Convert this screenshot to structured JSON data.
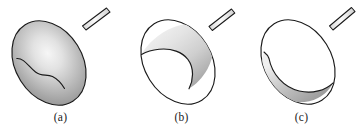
{
  "figure": {
    "background_color": "#ffffff",
    "stroke_color": "#1a1a1a",
    "panels": [
      {
        "id": "a",
        "label": "(a)",
        "caption_text": "(a)",
        "description": "shaded closed ellipsoid balloon with S-curve seam and tube stem",
        "shading": "radial-gradient",
        "highlight_color": "#f4f4f4",
        "mid_color": "#b4b4b4",
        "edge_color": "#8a8a8a",
        "interior_fill": "shaded",
        "has_stem": true
      },
      {
        "id": "b",
        "label": "(b)",
        "caption_text": "(b)",
        "description": "partially open ellipsoid, white circular mouth lower-left, shaded concave interior upper-right",
        "shading": "linear-gradient",
        "highlight_color": "#ededed",
        "mid_color": "#c9c9c9",
        "edge_color": "#9a9a9a",
        "interior_fill": "white",
        "has_stem": true
      },
      {
        "id": "c",
        "label": "(c)",
        "caption_text": "(c)",
        "description": "fully open ellipsoid, white interior with shaded crescent along lower-left rim",
        "shading": "linear-gradient",
        "highlight_color": "#e8e8e8",
        "mid_color": "#b8b8b8",
        "edge_color": "#969696",
        "interior_fill": "white",
        "has_stem": true
      }
    ]
  }
}
